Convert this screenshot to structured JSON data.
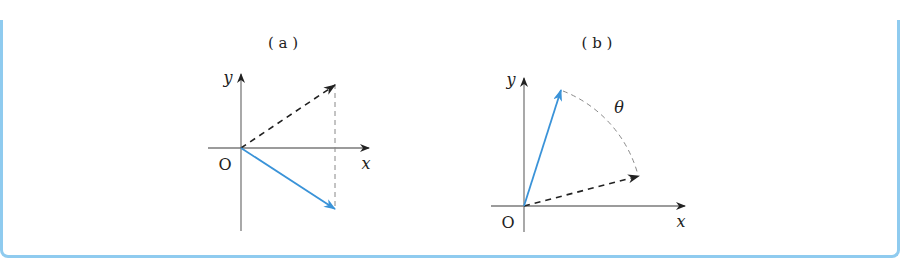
{
  "frame": {
    "border_color": "#8fcbef"
  },
  "panels": [
    {
      "caption": "( a )",
      "origin_label": "O",
      "x_label": "x",
      "y_label": "y",
      "vectors": [
        {
          "style": "dashed",
          "color": "#222222",
          "direction": "up-right"
        },
        {
          "style": "solid",
          "color": "#3a93d8",
          "direction": "down-right"
        }
      ],
      "guide": "vertical dashed line connecting both vector tips"
    },
    {
      "caption": "( b )",
      "origin_label": "O",
      "x_label": "x",
      "y_label": "y",
      "angle_label": "θ",
      "vectors": [
        {
          "style": "dashed",
          "color": "#222222",
          "direction": "shallow up-right"
        },
        {
          "style": "solid",
          "color": "#3a93d8",
          "direction": "steep up-right"
        }
      ],
      "guide": "dashed arc between vector tips (rotation by θ)"
    }
  ],
  "colors": {
    "axis": "#7a7a7a",
    "dashed_vector": "#222222",
    "blue_vector": "#3a93d8",
    "guide": "#888888"
  }
}
